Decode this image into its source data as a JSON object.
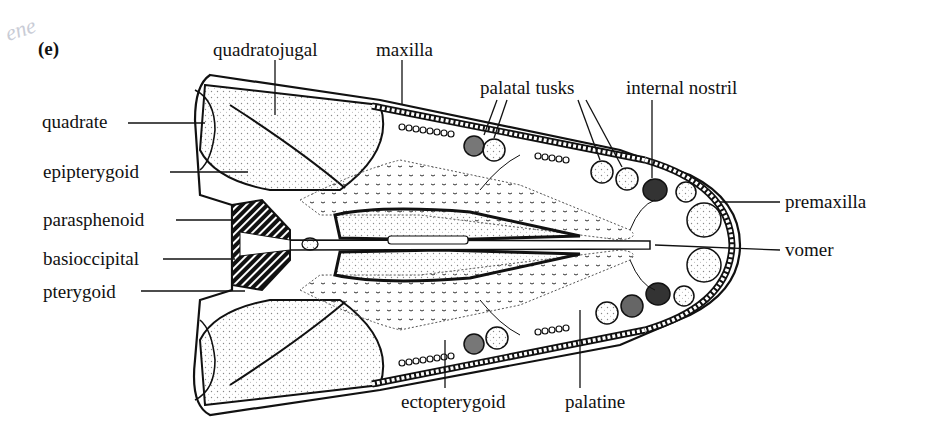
{
  "panel_label": "(e)",
  "margin_scrawl": "ene",
  "labels": {
    "quadratojugal": "quadratojugal",
    "maxilla": "maxilla",
    "palatal_tusks": "palatal tusks",
    "internal_nostril": "internal nostril",
    "quadrate": "quadrate",
    "epipterygoid": "epipterygoid",
    "parasphenoid": "parasphenoid",
    "basioccipital": "basioccipital",
    "pterygoid": "pterygoid",
    "premaxilla": "premaxilla",
    "vomer": "vomer",
    "ectopterygoid": "ectopterygoid",
    "palatine": "palatine"
  },
  "colors": {
    "ink": "#111111",
    "stipple": "#9a9a9a",
    "background": "#ffffff"
  }
}
